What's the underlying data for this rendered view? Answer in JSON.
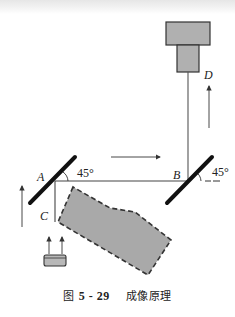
{
  "diagram": {
    "labels": {
      "A": "A",
      "B": "B",
      "C": "C",
      "D": "D",
      "angle_A": "45°",
      "angle_B": "45°"
    },
    "caption": {
      "figure_prefix": "图",
      "figure_number": "5 - 29",
      "title": "成像原理"
    },
    "components": [
      {
        "id": "camera",
        "description": "camera (two stacked gray boxes) at top right"
      },
      {
        "id": "mirror-a",
        "description": "mirror A at 45°"
      },
      {
        "id": "mirror-b",
        "description": "mirror B at 45°"
      },
      {
        "id": "object",
        "description": "gray dashed-outline object"
      },
      {
        "id": "light-source",
        "description": "light source with two upward arrows"
      }
    ],
    "colors": {
      "line": "#333333",
      "mirror": "#111111",
      "fill_gray": "#a9a9a9",
      "camera_fill": "#b0b0b0"
    }
  }
}
